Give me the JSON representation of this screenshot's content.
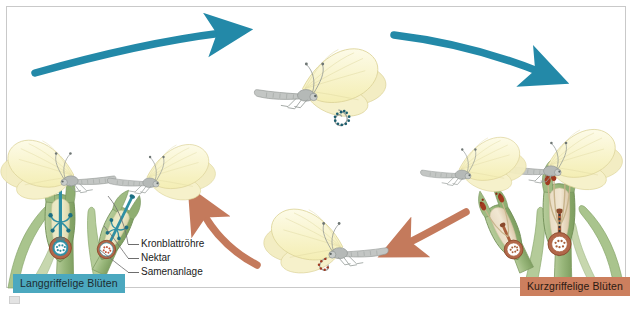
{
  "figure": {
    "kind": "botanical-cycle-diagram",
    "background": "#ffffff",
    "frame_color": "#c9c9c9"
  },
  "chips": {
    "long_styled": {
      "label": "Langgriffelige Blüten",
      "color": "#4ba8bf",
      "text_color": "#1d2b30"
    },
    "short_styled": {
      "label": "Kurzgriffelige Blüten",
      "color": "#cc7f5e",
      "text_color": "#2b1a12"
    }
  },
  "callouts": [
    {
      "label": "Kronblattröhre"
    },
    {
      "label": "Nektar"
    },
    {
      "label": "Samenanlage"
    }
  ],
  "arrows": {
    "top_left": {
      "color": "#2389a8",
      "direction": "right"
    },
    "top_right": {
      "color": "#2389a8",
      "direction": "right"
    },
    "bottom_right": {
      "color": "#c47a5c",
      "direction": "left"
    },
    "bottom_left": {
      "color": "#c47a5c",
      "direction": "up-left"
    }
  },
  "palette": {
    "wing_fill": "#f7f2c4",
    "wing_fill_light": "#fbf8dc",
    "wing_vein": "#e3dca0",
    "body_gray": "#b9bcbb",
    "body_gray_dark": "#8d9191",
    "leaf_green": "#9db87e",
    "leaf_green_dark": "#7d9a61",
    "leaf_green_pale": "#c2d3a6",
    "petal_cream": "#efe6b9",
    "teal_organ": "#2f8fa3",
    "teal_organ_dark": "#1d6f82",
    "rust_organ": "#a9603c",
    "rust_organ_dark": "#8a4a2c",
    "pollen_teal": "#1c5e6e",
    "pollen_rust": "#a03a20",
    "ovule_white": "#ffffff"
  },
  "butterflies": [
    {
      "name": "top-center",
      "facing": "left",
      "proboscis_pollen": "teal"
    },
    {
      "name": "bottom-center",
      "facing": "left",
      "proboscis_pollen": "rust"
    },
    {
      "name": "left-on-flower",
      "facing": "right",
      "proboscis_pollen": "teal"
    },
    {
      "name": "left-small-on-flower",
      "facing": "right",
      "proboscis_pollen": "teal"
    },
    {
      "name": "right-on-flower",
      "facing": "left",
      "proboscis_pollen": "rust"
    },
    {
      "name": "right-small-on-flower",
      "facing": "left",
      "proboscis_pollen": "rust"
    }
  ],
  "flowers": {
    "left_group": {
      "style": "long",
      "organ_color": "#2f8fa3",
      "count": 2
    },
    "right_group": {
      "style": "short",
      "organ_color": "#a9603c",
      "count": 2
    }
  }
}
